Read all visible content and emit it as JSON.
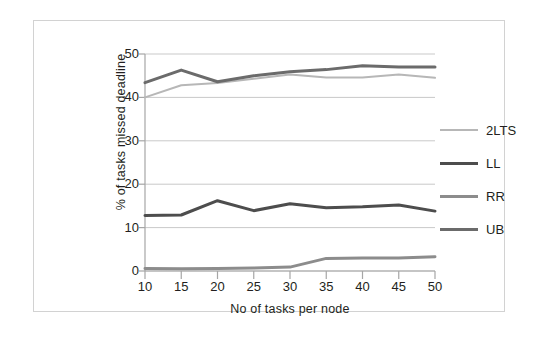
{
  "chart_data": {
    "type": "line",
    "title": "",
    "xlabel": "No of tasks per node",
    "ylabel": "% of tasks missed deadline",
    "x": [
      10,
      15,
      20,
      25,
      30,
      35,
      40,
      45,
      50
    ],
    "categories": [
      "10",
      "15",
      "20",
      "25",
      "30",
      "35",
      "40",
      "45",
      "50"
    ],
    "xlim": [
      10,
      50
    ],
    "ylim": [
      0,
      50
    ],
    "y_ticks": [
      0,
      10,
      20,
      30,
      40,
      50
    ],
    "y_tick_labels": [
      "0",
      "10",
      "20",
      "30",
      "40",
      "50"
    ],
    "grid": "horizontal",
    "legend_position": "right",
    "series": [
      {
        "name": "2LTS",
        "color": "#b7b7b7",
        "width": 2,
        "values": [
          40.0,
          42.8,
          43.3,
          44.3,
          45.3,
          44.6,
          44.6,
          45.3,
          44.5
        ]
      },
      {
        "name": "LL",
        "color": "#4d4d4d",
        "width": 3,
        "values": [
          12.8,
          12.9,
          16.2,
          13.9,
          15.5,
          14.6,
          14.8,
          15.2,
          13.8
        ]
      },
      {
        "name": "RR",
        "color": "#8c8c8c",
        "width": 3,
        "values": [
          0.6,
          0.5,
          0.6,
          0.7,
          0.9,
          2.9,
          3.0,
          3.0,
          3.3
        ]
      },
      {
        "name": "UB",
        "color": "#6b6b6b",
        "width": 3,
        "values": [
          43.4,
          46.3,
          43.6,
          45.0,
          45.9,
          46.4,
          47.3,
          47.0,
          47.0
        ]
      }
    ]
  },
  "legend": {
    "entries": [
      {
        "label": "2LTS"
      },
      {
        "label": "LL"
      },
      {
        "label": "RR"
      },
      {
        "label": "UB"
      }
    ]
  },
  "colors": {
    "frame": "#d2d2d2",
    "axis": "#a6a6a6",
    "grid": "#c9c9c9",
    "text": "#231f20",
    "background": "#ffffff"
  }
}
